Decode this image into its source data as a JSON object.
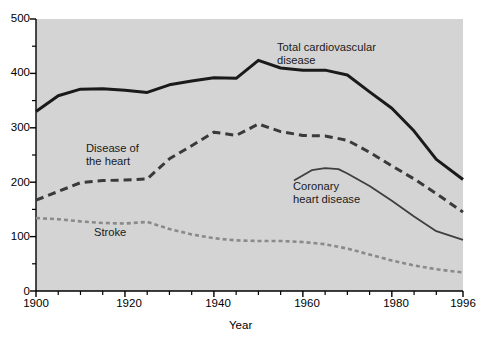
{
  "chart_data": {
    "type": "line",
    "title": "",
    "xlabel": "Year",
    "ylabel": "",
    "xlim": [
      1900,
      1996
    ],
    "ylim": [
      0,
      500
    ],
    "grid": false,
    "legend_position": "inline-annotations",
    "x_ticks_major": [
      1900,
      1920,
      1940,
      1960,
      1980,
      1996
    ],
    "x_tick_labels": [
      "1900",
      "1920",
      "1940",
      "1960",
      "1980",
      "1996"
    ],
    "x_ticks_minor": [
      1905,
      1910,
      1915,
      1925,
      1930,
      1935,
      1945,
      1950,
      1955,
      1965,
      1970,
      1975,
      1985,
      1990
    ],
    "y_ticks_major": [
      0,
      100,
      200,
      300,
      400,
      500
    ],
    "y_tick_labels": [
      "0",
      "100",
      "200",
      "300",
      "400",
      "500"
    ],
    "y_ticks_minor": [
      50,
      150,
      250,
      350,
      450
    ],
    "series": [
      {
        "name": "Total cardiovascular disease",
        "label": "Total cardiovascular\ndisease",
        "style": "solid-thick",
        "color": "#1a1a1a",
        "x": [
          1900,
          1905,
          1910,
          1915,
          1920,
          1925,
          1930,
          1935,
          1940,
          1945,
          1950,
          1955,
          1960,
          1965,
          1970,
          1975,
          1980,
          1985,
          1990,
          1996
        ],
        "y": [
          330,
          359,
          371,
          372,
          369,
          365,
          379,
          386,
          392,
          391,
          424,
          410,
          406,
          406,
          397,
          366,
          336,
          294,
          242,
          205
        ]
      },
      {
        "name": "Disease of the heart",
        "label": "Disease of\nthe heart",
        "style": "dashed-thick",
        "color": "#3a3a3a",
        "x": [
          1900,
          1905,
          1910,
          1915,
          1920,
          1925,
          1930,
          1935,
          1940,
          1945,
          1950,
          1955,
          1960,
          1965,
          1970,
          1975,
          1980,
          1985,
          1990,
          1996
        ],
        "y": [
          167,
          183,
          199,
          203,
          204,
          206,
          243,
          267,
          292,
          286,
          307,
          293,
          286,
          285,
          277,
          255,
          230,
          206,
          179,
          145
        ]
      },
      {
        "name": "Coronary heart disease",
        "label": "Coronary\nheart disease",
        "style": "solid-thin",
        "color": "#3f3f3f",
        "x": [
          1958,
          1962,
          1965,
          1968,
          1970,
          1975,
          1980,
          1985,
          1990,
          1996
        ],
        "y": [
          203,
          222,
          226,
          224,
          216,
          193,
          166,
          137,
          110,
          94
        ]
      },
      {
        "name": "Stroke",
        "label": "Stroke",
        "style": "dotted-thick",
        "color": "#8a8a8a",
        "x": [
          1900,
          1905,
          1910,
          1915,
          1920,
          1925,
          1930,
          1935,
          1940,
          1945,
          1950,
          1955,
          1960,
          1965,
          1970,
          1975,
          1980,
          1985,
          1990,
          1996
        ],
        "y": [
          134,
          132,
          128,
          125,
          124,
          127,
          114,
          104,
          97,
          93,
          92,
          92,
          90,
          86,
          78,
          67,
          56,
          47,
          40,
          34
        ]
      }
    ]
  },
  "axes": {
    "x_title": "Year",
    "y_labels": [
      "500",
      "400",
      "300",
      "200",
      "100",
      "0"
    ],
    "x_labels": [
      "1900",
      "1920",
      "1940",
      "1960",
      "1980",
      "1996"
    ]
  },
  "annotations": {
    "total_cvd_line1": "Total cardiovascular",
    "total_cvd_line2": "disease",
    "heart_line1": "Disease of",
    "heart_line2": "the heart",
    "coronary_line1": "Coronary",
    "coronary_line2": "heart disease",
    "stroke": "Stroke"
  },
  "colors": {
    "plot_background": "#d4d4d4",
    "figure_background": "#ffffff",
    "total_cvd": "#1a1a1a",
    "heart": "#3a3a3a",
    "coronary": "#3f3f3f",
    "stroke": "#8a8a8a",
    "axis": "#000000"
  }
}
